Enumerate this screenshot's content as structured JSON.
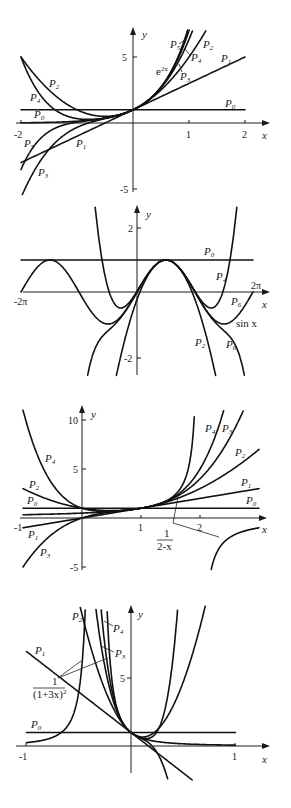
{
  "chart_data": [
    {
      "type": "line",
      "title": "Taylor polynomials of e^{2x} about x=0",
      "function_label": "e^{2x}",
      "xlabel": "x",
      "ylabel": "y",
      "xlim": [
        -2,
        2
      ],
      "ylim": [
        -5,
        7
      ],
      "x_ticks": [
        -2,
        1,
        2
      ],
      "y_ticks": [
        5,
        -5
      ],
      "series": [
        {
          "name": "e^{2x}",
          "coeffs": null
        },
        {
          "name": "P0",
          "coeffs": [
            1
          ]
        },
        {
          "name": "P1",
          "coeffs": [
            1,
            2
          ]
        },
        {
          "name": "P2",
          "coeffs": [
            1,
            2,
            2
          ]
        },
        {
          "name": "P3",
          "coeffs": [
            1,
            2,
            2,
            1.3333
          ]
        },
        {
          "name": "P4",
          "coeffs": [
            1,
            2,
            2,
            1.3333,
            0.6667
          ]
        },
        {
          "name": "P5",
          "coeffs": [
            1,
            2,
            2,
            1.3333,
            0.6667,
            0.2667
          ]
        }
      ],
      "grid": false,
      "legend": "inline labels"
    },
    {
      "type": "line",
      "title": "Taylor polynomials of sin x about x=pi/2",
      "function_label": "sin x",
      "xlabel": "x",
      "ylabel": "y",
      "xlim": [
        "-2π",
        "2π"
      ],
      "ylim": [
        -2.5,
        2.5
      ],
      "x_ticks": [
        "-2π",
        "2π"
      ],
      "y_ticks": [
        2,
        -2
      ],
      "series": [
        {
          "name": "sin x"
        },
        {
          "name": "P0"
        },
        {
          "name": "P2"
        },
        {
          "name": "P4"
        },
        {
          "name": "P6"
        }
      ],
      "grid": false,
      "legend": "inline labels"
    },
    {
      "type": "line",
      "title": "Taylor polynomials of 1/(2-x) about x=1",
      "function_label": "1/(2-x)",
      "xlabel": "x",
      "ylabel": "y",
      "xlim": [
        -1,
        2.5
      ],
      "ylim": [
        -5,
        11
      ],
      "x_ticks": [
        -1,
        1,
        2
      ],
      "y_ticks": [
        10,
        5,
        -5
      ],
      "series": [
        {
          "name": "1/(2-x)"
        },
        {
          "name": "P0"
        },
        {
          "name": "P1"
        },
        {
          "name": "P2"
        },
        {
          "name": "P3"
        },
        {
          "name": "P4"
        }
      ],
      "grid": false,
      "legend": "inline labels"
    },
    {
      "type": "line",
      "title": "Taylor polynomials of 1/(1+3x)^2 about x=0",
      "function_label": "1/(1+3x)^2",
      "xlabel": "x",
      "ylabel": "y",
      "xlim": [
        -1,
        1
      ],
      "ylim": [
        -2,
        10
      ],
      "x_ticks": [
        -1,
        1
      ],
      "y_ticks": [
        5
      ],
      "series": [
        {
          "name": "1/(1+3x)^2"
        },
        {
          "name": "P0"
        },
        {
          "name": "P1"
        },
        {
          "name": "P2"
        },
        {
          "name": "P3"
        },
        {
          "name": "P4"
        }
      ],
      "grid": false,
      "legend": "inline labels"
    }
  ],
  "labels": {
    "x_axis": "x",
    "y_axis": "y",
    "p1": {
      "tick_m2": "-2",
      "tick_1": "1",
      "tick_2": "2",
      "tick_5": "5",
      "tick_m5": "-5",
      "func": "e",
      "func_sup": "2x"
    },
    "p2": {
      "tick_m2pi": "-2π",
      "tick_2pi": "2π",
      "tick_2": "2",
      "tick_m2": "-2",
      "func": "sin x"
    },
    "p3": {
      "tick_m1": "-1",
      "tick_1": "1",
      "tick_2": "2",
      "tick_10": "10",
      "tick_5": "5",
      "tick_m5": "-5",
      "func_num": "1",
      "func_den": "2-x"
    },
    "p4": {
      "tick_m1": "-1",
      "tick_1": "1",
      "tick_5": "5",
      "func_num": "1",
      "func_den": "(1+3x)",
      "func_den_sup": "2"
    },
    "P": "P",
    "sub0": "0",
    "sub1": "1",
    "sub2": "2",
    "sub3": "3",
    "sub4": "4",
    "sub5": "5",
    "sub6": "6"
  }
}
